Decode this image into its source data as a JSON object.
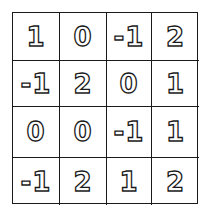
{
  "grid": {
    "rows": 4,
    "cols": 4,
    "cells": [
      [
        "1",
        "0",
        "-1",
        "2"
      ],
      [
        "-1",
        "2",
        "0",
        "1"
      ],
      [
        "0",
        "0",
        "-1",
        "1"
      ],
      [
        "-1",
        "2",
        "1",
        "2"
      ]
    ]
  }
}
